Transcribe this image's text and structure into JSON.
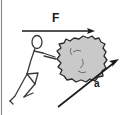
{
  "figure": {
    "type": "physics-free-body-diagram",
    "background_color": "#ffffff",
    "ink_color": "#1a1a1a",
    "rock_fill_color": "#c9c9c9",
    "rock_stroke_color": "#2b2b2b",
    "border": {
      "left_edge_line": true,
      "color": "#7a7a7a"
    },
    "labels": {
      "force": "F",
      "acceleration": "a"
    },
    "vectors": [
      {
        "name": "force-vector",
        "label": "F",
        "orientation": "horizontal",
        "direction": "right",
        "start": [
          22,
          31
        ],
        "end": [
          95,
          31
        ]
      },
      {
        "name": "acceleration-vector",
        "label": "a",
        "orientation": "diagonal",
        "direction": "up-right",
        "start": [
          58,
          107
        ],
        "end": [
          119,
          59
        ]
      }
    ],
    "objects": [
      {
        "name": "stick-figure-person",
        "role": "pusher",
        "facing": "right"
      },
      {
        "name": "rock",
        "role": "pushed-object",
        "shape": "irregular-polygon"
      }
    ]
  }
}
